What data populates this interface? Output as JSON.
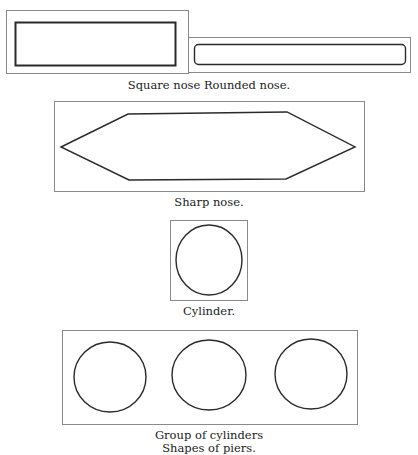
{
  "figure": {
    "title": "Shapes of piers.",
    "panels": [
      {
        "id": "square-nose",
        "label": "Square nose"
      },
      {
        "id": "rounded-nose",
        "label": "Rounded nose."
      },
      {
        "id": "sharp-nose",
        "label": "Sharp nose."
      },
      {
        "id": "cylinder",
        "label": "Cylinder."
      },
      {
        "id": "group-of-cylinders",
        "label": "Group of cylinders"
      }
    ],
    "captions": {
      "row1": "Square nose Rounded nose.",
      "row2": "Sharp nose.",
      "row3": "Cylinder.",
      "row4": "Group of cylinders",
      "final": "Shapes of piers."
    },
    "colors": {
      "frame": "#8a8a8a",
      "stroke": "#2a2a2a",
      "background": "#ffffff"
    }
  }
}
